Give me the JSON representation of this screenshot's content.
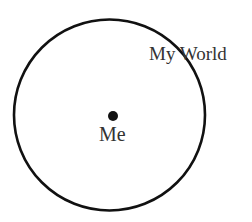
{
  "diagram": {
    "circle": {
      "label": "My World",
      "stroke_color": "#111111",
      "fill_color": "#ffffff"
    },
    "center_point": {
      "label": "Me",
      "color": "#111111"
    },
    "text_color": "#333333"
  }
}
